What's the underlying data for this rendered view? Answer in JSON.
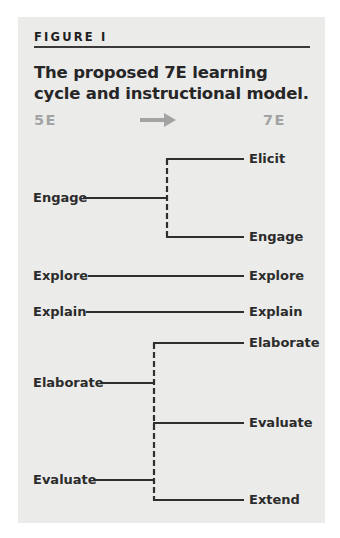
{
  "figure": {
    "label": "FIGURE I",
    "title": "The proposed 7E learning cycle and instructional model.",
    "columns": {
      "left_header": "5E",
      "right_header": "7E",
      "arrow_icon": "right-arrow-icon"
    },
    "colors": {
      "panel_background": "#ebebea",
      "text": "#2b2b2b",
      "header_gray": "#a3a3a3",
      "line": "#2f2f2f"
    },
    "left_phases": [
      {
        "label": "Engage"
      },
      {
        "label": "Explore"
      },
      {
        "label": "Explain"
      },
      {
        "label": "Elaborate"
      },
      {
        "label": "Evaluate"
      }
    ],
    "right_phases": [
      {
        "label": "Elicit"
      },
      {
        "label": "Engage"
      },
      {
        "label": "Explore"
      },
      {
        "label": "Explain"
      },
      {
        "label": "Elaborate"
      },
      {
        "label": "Evaluate"
      },
      {
        "label": "Extend"
      }
    ],
    "mappings": [
      {
        "from": "Engage",
        "to": [
          "Elicit",
          "Engage"
        ]
      },
      {
        "from": "Explore",
        "to": [
          "Explore"
        ]
      },
      {
        "from": "Explain",
        "to": [
          "Explain"
        ]
      },
      {
        "from": "Elaborate",
        "to": [
          "Elaborate",
          "Evaluate",
          "Extend"
        ]
      },
      {
        "from": "Evaluate",
        "to": [
          "Elaborate",
          "Evaluate",
          "Extend"
        ]
      }
    ]
  }
}
